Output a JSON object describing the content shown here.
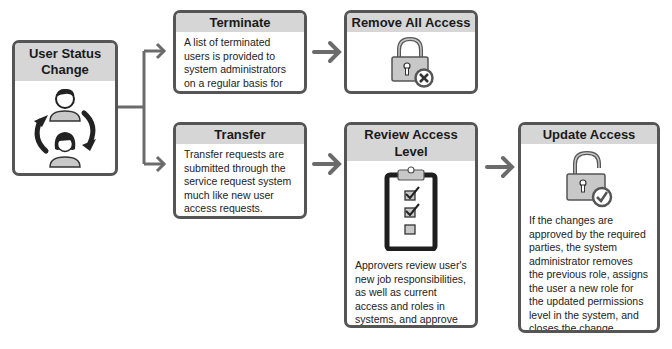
{
  "diagram": {
    "start": {
      "title": "User Status Change",
      "icon": "users-cycle-icon"
    },
    "terminate": {
      "title": "Terminate",
      "text": "A list of terminated users is provided to system administrators on a regular basis for removal."
    },
    "remove_all_access": {
      "title": "Remove All Access",
      "icon": "lock-x-icon"
    },
    "transfer": {
      "title": "Transfer",
      "text": "Transfer requests are submitted through the service request system much like new user access requests."
    },
    "review_access_level": {
      "title": "Review Access Level",
      "icon": "clipboard-checklist-icon",
      "text": "Approvers review user's new job responsibilities, as well as current access and roles in systems, and approve or deny the change request ticket."
    },
    "update_access": {
      "title": "Update Access",
      "icon": "unlock-check-icon",
      "text": "If the changes are approved by the required parties, the system administrator removes the previous role, assigns the user a new role for the updated permissions level in the system, and closes the change request ticket."
    },
    "colors": {
      "border": "#555555",
      "header": "#d6d6d6",
      "arrow": "#6b6b6b",
      "icon_fill": "#c8c8c8"
    }
  }
}
